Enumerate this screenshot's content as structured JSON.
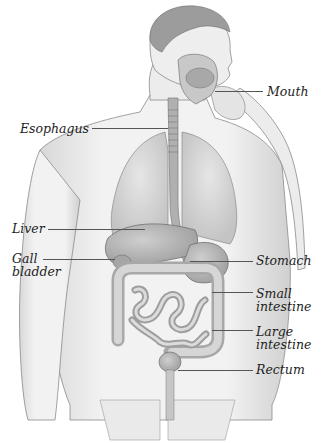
{
  "diagram": {
    "colors": {
      "background": "#ffffff",
      "skin": "#f0f0f0",
      "skin_shade": "#c9c9c9",
      "outline": "#7a7a7a",
      "organ": "#bdbdbd",
      "organ_dark": "#9a9a9a",
      "lung": "#dcdcdc",
      "label": "#1e1e1e",
      "leader": "#555555"
    },
    "labels": [
      {
        "id": "mouth",
        "lines": [
          "Mouth"
        ],
        "x": 267,
        "y": 85,
        "line_x1": 215,
        "line_x2": 263,
        "line_y": 91
      },
      {
        "id": "esophagus",
        "lines": [
          "Esophagus"
        ],
        "x": 20,
        "y": 122,
        "line_x1": 92,
        "line_x2": 168,
        "line_y": 128
      },
      {
        "id": "liver",
        "lines": [
          "Liver"
        ],
        "x": 12,
        "y": 222,
        "line_x1": 48,
        "line_x2": 145,
        "line_y": 229
      },
      {
        "id": "gall-bladder",
        "lines": [
          "Gall",
          "bladder"
        ],
        "x": 12,
        "y": 252,
        "line_x1": 43,
        "line_x2": 115,
        "line_y": 259
      },
      {
        "id": "stomach",
        "lines": [
          "Stomach"
        ],
        "x": 256,
        "y": 254,
        "line_x1": 190,
        "line_x2": 253,
        "line_y": 261
      },
      {
        "id": "small-intestine",
        "lines": [
          "Small",
          "intestine"
        ],
        "x": 256,
        "y": 287,
        "line_x1": 212,
        "line_x2": 253,
        "line_y": 292
      },
      {
        "id": "large-intestine",
        "lines": [
          "Large",
          "intestine"
        ],
        "x": 256,
        "y": 325,
        "line_x1": 212,
        "line_x2": 253,
        "line_y": 330
      },
      {
        "id": "rectum",
        "lines": [
          "Rectum"
        ],
        "x": 256,
        "y": 363,
        "line_x1": 178,
        "line_x2": 253,
        "line_y": 370
      }
    ]
  }
}
